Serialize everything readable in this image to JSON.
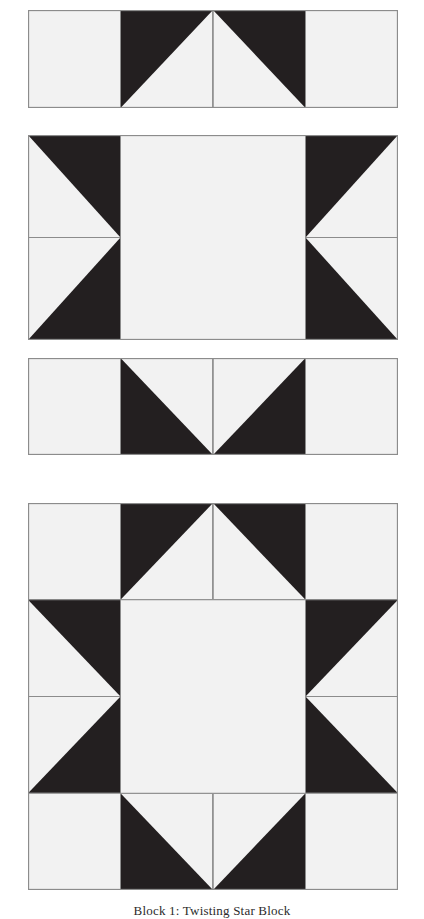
{
  "page": {
    "background_color": "#ffffff",
    "width": 424,
    "height": 919
  },
  "palette": {
    "light_fabric": "#f2f2f2",
    "dark_fabric": "#231f20",
    "outline": "#8c8c8c",
    "caption_text": "#2b2b2b"
  },
  "caption": {
    "text": "Block 1: Twisting Star Block"
  },
  "diagram": {
    "type": "quilt-block-piecing-diagram",
    "unit_count": 4,
    "grid": "4x4 sawtooth star",
    "blocks": [
      {
        "id": "unit-row-top",
        "name": "Top Row Unit",
        "label": "top-row-unit",
        "x": 28,
        "y": 10,
        "width": 370,
        "height": 98,
        "cols": 4,
        "rows": 1,
        "cells": [
          {
            "col": 0,
            "row": 0,
            "kind": "plain",
            "fill": "light"
          },
          {
            "col": 1,
            "row": 0,
            "kind": "hst",
            "dark_corner": "top-left"
          },
          {
            "col": 2,
            "row": 0,
            "kind": "hst",
            "dark_corner": "top-right"
          },
          {
            "col": 3,
            "row": 0,
            "kind": "plain",
            "fill": "light"
          }
        ]
      },
      {
        "id": "unit-center-band",
        "name": "Center Band Unit",
        "label": "center-band-unit",
        "x": 28,
        "y": 135,
        "width": 370,
        "height": 205,
        "cols": 4,
        "rows": 2,
        "cells": [
          {
            "col": 0,
            "row": 0,
            "kind": "hst",
            "dark_corner": "top-right"
          },
          {
            "col": 3,
            "row": 0,
            "kind": "hst",
            "dark_corner": "top-left"
          },
          {
            "col": 0,
            "row": 1,
            "kind": "hst",
            "dark_corner": "bottom-right"
          },
          {
            "col": 3,
            "row": 1,
            "kind": "hst",
            "dark_corner": "bottom-left"
          },
          {
            "col": 1,
            "row": 0,
            "kind": "center-square",
            "span_cols": 2,
            "span_rows": 2,
            "fill": "light"
          }
        ]
      },
      {
        "id": "unit-row-bottom",
        "name": "Bottom Row Unit",
        "label": "bottom-row-unit",
        "x": 28,
        "y": 358,
        "width": 370,
        "height": 97,
        "cols": 4,
        "rows": 1,
        "cells": [
          {
            "col": 0,
            "row": 0,
            "kind": "plain",
            "fill": "light"
          },
          {
            "col": 1,
            "row": 0,
            "kind": "hst",
            "dark_corner": "bottom-left"
          },
          {
            "col": 2,
            "row": 0,
            "kind": "hst",
            "dark_corner": "bottom-right"
          },
          {
            "col": 3,
            "row": 0,
            "kind": "plain",
            "fill": "light"
          }
        ]
      },
      {
        "id": "assembled-block",
        "name": "Assembled Star Block",
        "label": "assembled-star-block",
        "x": 28,
        "y": 503,
        "width": 370,
        "height": 387,
        "cols": 4,
        "rows": 4,
        "cells": [
          {
            "col": 0,
            "row": 0,
            "kind": "plain",
            "fill": "light"
          },
          {
            "col": 1,
            "row": 0,
            "kind": "hst",
            "dark_corner": "top-left"
          },
          {
            "col": 2,
            "row": 0,
            "kind": "hst",
            "dark_corner": "top-right"
          },
          {
            "col": 3,
            "row": 0,
            "kind": "plain",
            "fill": "light"
          },
          {
            "col": 0,
            "row": 1,
            "kind": "hst",
            "dark_corner": "top-right"
          },
          {
            "col": 3,
            "row": 1,
            "kind": "hst",
            "dark_corner": "top-left"
          },
          {
            "col": 0,
            "row": 2,
            "kind": "hst",
            "dark_corner": "bottom-right"
          },
          {
            "col": 3,
            "row": 2,
            "kind": "hst",
            "dark_corner": "bottom-left"
          },
          {
            "col": 0,
            "row": 3,
            "kind": "plain",
            "fill": "light"
          },
          {
            "col": 1,
            "row": 3,
            "kind": "hst",
            "dark_corner": "bottom-left"
          },
          {
            "col": 2,
            "row": 3,
            "kind": "hst",
            "dark_corner": "bottom-right"
          },
          {
            "col": 3,
            "row": 3,
            "kind": "plain",
            "fill": "light"
          },
          {
            "col": 1,
            "row": 1,
            "kind": "center-square",
            "span_cols": 2,
            "span_rows": 2,
            "fill": "light"
          }
        ]
      }
    ]
  }
}
